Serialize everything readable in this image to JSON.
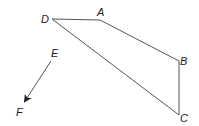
{
  "diagram": {
    "line_color": "#555555",
    "label_color": "#222222",
    "quadrilateral": {
      "vertices": [
        {
          "label": "D",
          "x": 52,
          "y": 19,
          "lx": 41,
          "ly": 23
        },
        {
          "label": "A",
          "x": 100,
          "y": 20,
          "lx": 97,
          "ly": 16
        },
        {
          "label": "B",
          "x": 179,
          "y": 61,
          "lx": 180,
          "ly": 65
        },
        {
          "label": "C",
          "x": 179,
          "y": 115,
          "lx": 180,
          "ly": 122
        }
      ]
    },
    "vector": {
      "start": {
        "label": "E",
        "x": 51,
        "y": 61,
        "lx": 51,
        "ly": 57
      },
      "end": {
        "label": "F",
        "x": 24,
        "y": 103,
        "lx": 16,
        "ly": 116
      }
    }
  }
}
